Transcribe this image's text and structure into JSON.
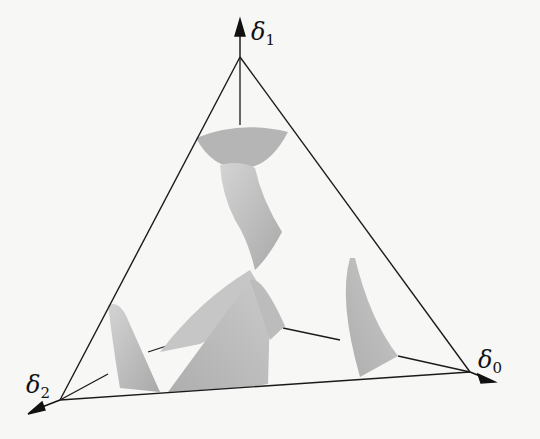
{
  "diagram": {
    "type": "simplex-3d",
    "axes": [
      {
        "symbol": "δ",
        "subscript": "1",
        "position": "top"
      },
      {
        "symbol": "δ",
        "subscript": "0",
        "position": "right"
      },
      {
        "symbol": "δ",
        "subscript": "2",
        "position": "left"
      }
    ],
    "colors": {
      "edge": "#1a1a1a",
      "surface": "#b8b8b8",
      "surface_light": "#d0d0d0",
      "background": "#f7f7f5"
    }
  }
}
